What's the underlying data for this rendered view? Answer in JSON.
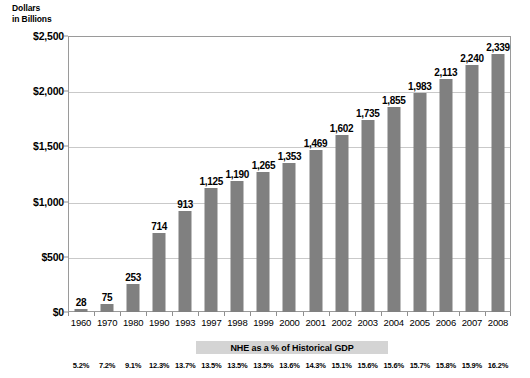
{
  "chart_data": {
    "type": "bar",
    "title": "",
    "axis_title_line1": "Dollars",
    "axis_title_line2": "in Billions",
    "xlabel": "",
    "ylabel": "Dollars in Billions",
    "ylim": [
      0,
      2500
    ],
    "yticks": [
      0,
      500,
      1000,
      1500,
      2000,
      2500
    ],
    "ytick_labels": [
      "$0",
      "$500",
      "$1,000",
      "$1,500",
      "$2,000",
      "$2,500"
    ],
    "grid": true,
    "legend": "none",
    "bar_color": "#808080",
    "categories": [
      "1960",
      "1970",
      "1980",
      "1990",
      "1993",
      "1997",
      "1998",
      "1999",
      "2000",
      "2001",
      "2002",
      "2003",
      "2004",
      "2005",
      "2006",
      "2007",
      "2008"
    ],
    "values": [
      28,
      75,
      253,
      714,
      913,
      1125,
      1190,
      1265,
      1353,
      1469,
      1602,
      1735,
      1855,
      1983,
      2113,
      2240,
      2339
    ],
    "value_labels": [
      "28",
      "75",
      "253",
      "714",
      "913",
      "1,125",
      "1,190",
      "1,265",
      "1,353",
      "1,469",
      "1,602",
      "1,735",
      "1,855",
      "1,983",
      "2,113",
      "2,240",
      "2,339"
    ],
    "annotation_row": {
      "label": "NHE as a % of Historical GDP",
      "values": [
        "5.2%",
        "7.2%",
        "9.1%",
        "12.3%",
        "13.7%",
        "13.5%",
        "13.5%",
        "13.5%",
        "13.6%",
        "14.3%",
        "15.1%",
        "15.6%",
        "15.6%",
        "15.7%",
        "15.8%",
        "15.9%",
        "16.2%"
      ]
    }
  }
}
